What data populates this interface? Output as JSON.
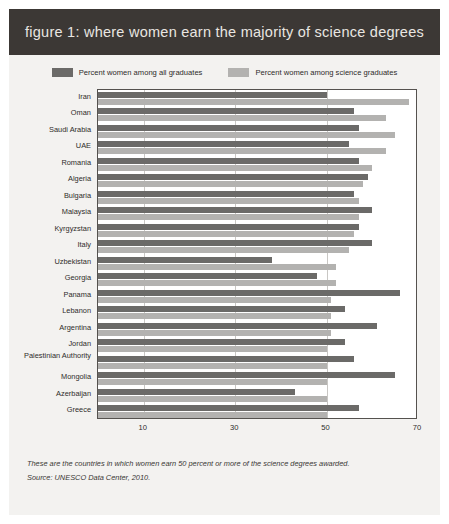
{
  "header": {
    "title": "figure 1: where women earn the majority of science degrees",
    "banner_color": "#3c3835",
    "title_color": "#e9e6e1"
  },
  "legend": {
    "position": "top-center",
    "items": [
      {
        "label": "Percent women among all graduates",
        "color": "#6b6a68",
        "key": "all_graduates"
      },
      {
        "label": "Percent women among science graduates",
        "color": "#b3b2b0",
        "key": "science_graduates"
      }
    ]
  },
  "footnote": {
    "lines": [
      "These are the countries in which women earn 50 percent or more of the science degrees awarded.",
      "Source: UNESCO Data Center, 2010."
    ]
  },
  "chart_data": {
    "type": "bar",
    "orientation": "horizontal",
    "title": "figure 1: where women earn the majority of science degrees",
    "xlabel": "",
    "ylabel": "",
    "xlim": [
      0,
      70
    ],
    "ylim": null,
    "grid": true,
    "gridlines": [
      10,
      30,
      50,
      70
    ],
    "xticks": [
      "10",
      "30",
      "50",
      "70"
    ],
    "xtick_values": [
      10,
      30,
      50,
      70
    ],
    "legend_position": "top-center",
    "categories": [
      "Iran",
      "Oman",
      "Saudi Arabia",
      "UAE",
      "Romania",
      "Algeria",
      "Bulgaria",
      "Malaysia",
      "Kyrgyzstan",
      "Italy",
      "Uzbekistan",
      "Georgia",
      "Panama",
      "Lebanon",
      "Argentina",
      "Jordan",
      "Palestinian Authority",
      "Mongolia",
      "Azerbaijan",
      "Greece"
    ],
    "series": [
      {
        "name": "Percent women among all graduates",
        "color": "#6b6a68",
        "values": [
          50,
          56,
          57,
          55,
          57,
          59,
          56,
          60,
          57,
          60,
          38,
          48,
          66,
          54,
          61,
          54,
          56,
          65,
          43,
          57
        ]
      },
      {
        "name": "Percent women among science graduates",
        "color": "#b3b2b0",
        "values": [
          68,
          63,
          65,
          63,
          60,
          58,
          57,
          57,
          56,
          55,
          52,
          52,
          51,
          51,
          51,
          50,
          50,
          50,
          50,
          50
        ]
      }
    ]
  },
  "style": {
    "card_background": "#f3f2f0",
    "plot_background": "#ffffff",
    "plot_border": "#55524f",
    "gridline_color": "#c9c7c4",
    "text_color": "#2e2c2a"
  }
}
